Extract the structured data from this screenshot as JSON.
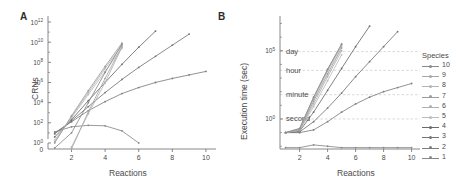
{
  "figure": {
    "panel_a_letter": "A",
    "panel_b_letter": "B"
  },
  "panel_a": {
    "ylabel": "CRNs",
    "xlabel": "Reactions",
    "y_ticks": [
      "0",
      "10^0",
      "10^2",
      "10^4",
      "10^6",
      "10^8",
      "10^10",
      "10^12"
    ],
    "y_tick_mantissa": "10",
    "y_tick_exponents": [
      "0",
      "2",
      "4",
      "6",
      "8",
      "10",
      "12"
    ],
    "x_ticks": [
      "2",
      "4",
      "6",
      "8",
      "10"
    ]
  },
  "panel_b": {
    "ylabel": "Execution time (sec)",
    "xlabel": "Reactions",
    "y_tick_exponents": [
      "0",
      "5"
    ],
    "y_tick_mantissa": "10",
    "x_ticks": [
      "2",
      "4",
      "6",
      "8",
      "10"
    ],
    "gridline_annotations": [
      "day",
      "hour",
      "minute",
      "second"
    ]
  },
  "legend": {
    "title": "Species",
    "items": [
      {
        "label": "10",
        "color": "#8a8a8a"
      },
      {
        "label": "9",
        "color": "#a8a8a8"
      },
      {
        "label": "8",
        "color": "#b4b4b4"
      },
      {
        "label": "7",
        "color": "#9c9c9c"
      },
      {
        "label": "6",
        "color": "#b0b0b0"
      },
      {
        "label": "5",
        "color": "#bcbcbc"
      },
      {
        "label": "4",
        "color": "#6a6a6a"
      },
      {
        "label": "3",
        "color": "#757575"
      },
      {
        "label": "2",
        "color": "#7e7e7e"
      },
      {
        "label": "1",
        "color": "#888888"
      }
    ]
  },
  "chart_data": [
    {
      "type": "line",
      "panel": "A",
      "title": "",
      "xlabel": "Reactions",
      "ylabel": "CRNs",
      "xlim": [
        0.6,
        10.6
      ],
      "ylim_log10": [
        -0.6,
        12.4
      ],
      "yscale": "log",
      "grid": false,
      "legend_position": "right-outside",
      "series": [
        {
          "name": "1",
          "color": "#888888",
          "x": [
            1,
            2,
            3,
            4,
            5,
            6
          ],
          "y_log10": [
            1.1,
            1.6,
            1.75,
            1.7,
            1.2,
            0.0
          ]
        },
        {
          "name": "2",
          "color": "#7e7e7e",
          "x": [
            1,
            2,
            3,
            4,
            5,
            6,
            7,
            8,
            9,
            10
          ],
          "y_log10": [
            1.0,
            2.1,
            3.2,
            4.1,
            4.9,
            5.5,
            6.0,
            6.4,
            6.75,
            7.1
          ]
        },
        {
          "name": "3",
          "color": "#757575",
          "x": [
            1,
            2,
            3,
            4,
            5,
            6,
            7,
            8,
            9
          ],
          "y_log10": [
            0.9,
            2.2,
            3.6,
            5.0,
            6.3,
            7.5,
            8.6,
            9.7,
            10.8
          ]
        },
        {
          "name": "4",
          "color": "#6a6a6a",
          "x": [
            1,
            2,
            3,
            4,
            5,
            6,
            7
          ],
          "y_log10": [
            0.6,
            2.3,
            4.2,
            6.0,
            7.8,
            9.5,
            11.1
          ]
        },
        {
          "name": "5",
          "color": "#bcbcbc",
          "x": [
            1,
            2,
            3,
            4,
            5
          ],
          "y_log10": [
            0.3,
            2.5,
            4.8,
            7.1,
            9.4
          ]
        },
        {
          "name": "6",
          "color": "#b0b0b0",
          "x": [
            1,
            2,
            3,
            4,
            5
          ],
          "y_log10": [
            0.1,
            2.6,
            5.0,
            7.4,
            9.7
          ]
        },
        {
          "name": "7",
          "color": "#9c9c9c",
          "x": [
            1,
            2,
            3,
            4,
            5
          ],
          "y_log10": [
            0.0,
            2.7,
            5.2,
            7.6,
            9.9
          ]
        },
        {
          "name": "8",
          "color": "#b4b4b4",
          "x": [
            2,
            3,
            4,
            5
          ],
          "y_log10": [
            -0.4,
            2.9,
            6.0,
            9.5
          ]
        },
        {
          "name": "9",
          "color": "#a8a8a8",
          "x": [
            2,
            3,
            4,
            5
          ],
          "y_log10": [
            -0.6,
            3.1,
            6.4,
            9.6
          ]
        },
        {
          "name": "10",
          "color": "#8a8a8a",
          "x": [
            1,
            2,
            3,
            4,
            5
          ],
          "y_log10": [
            -0.5,
            1.0,
            4.0,
            7.0,
            9.8
          ]
        }
      ]
    },
    {
      "type": "line",
      "panel": "B",
      "title": "",
      "xlabel": "Reactions",
      "ylabel": "Execution time (sec)",
      "xlim": [
        0.6,
        10.6
      ],
      "ylim_log10": [
        -2.2,
        7.4
      ],
      "yscale": "log",
      "grid": true,
      "legend_position": "right-outside",
      "gridlines": [
        {
          "label": "day",
          "y_log10": 4.94
        },
        {
          "label": "hour",
          "y_log10": 3.56
        },
        {
          "label": "minute",
          "y_log10": 1.78
        },
        {
          "label": "second",
          "y_log10": 0.0
        }
      ],
      "series": [
        {
          "name": "1",
          "color": "#888888",
          "x": [
            1,
            2,
            3,
            4,
            5,
            6,
            7,
            8,
            9,
            10
          ],
          "y_log10": [
            -2.1,
            -2.1,
            -1.9,
            -2.0,
            -2.1,
            -2.1,
            -2.1,
            -2.1,
            -2.1,
            -2.1
          ]
        },
        {
          "name": "2",
          "color": "#7e7e7e",
          "x": [
            1,
            2,
            3,
            4,
            5,
            6,
            7,
            8,
            9,
            10
          ],
          "y_log10": [
            -1.0,
            -1.0,
            -0.8,
            -0.2,
            0.5,
            1.1,
            1.6,
            2.0,
            2.3,
            2.6
          ]
        },
        {
          "name": "3",
          "color": "#757575",
          "x": [
            1,
            2,
            3,
            4,
            5,
            6,
            7,
            8,
            9
          ],
          "y_log10": [
            -1.0,
            -0.95,
            -0.2,
            0.8,
            1.9,
            3.1,
            4.2,
            5.3,
            6.4
          ]
        },
        {
          "name": "4",
          "color": "#6a6a6a",
          "x": [
            1,
            2,
            3,
            4,
            5,
            6,
            7
          ],
          "y_log10": [
            -1.0,
            -0.9,
            0.5,
            2.1,
            3.7,
            5.3,
            6.8
          ]
        },
        {
          "name": "5",
          "color": "#bcbcbc",
          "x": [
            1,
            2,
            3,
            4,
            5
          ],
          "y_log10": [
            -1.0,
            -0.85,
            0.9,
            2.8,
            4.7
          ]
        },
        {
          "name": "6",
          "color": "#b0b0b0",
          "x": [
            1,
            2,
            3,
            4,
            5
          ],
          "y_log10": [
            -1.0,
            -0.8,
            1.1,
            3.1,
            5.0
          ]
        },
        {
          "name": "7",
          "color": "#9c9c9c",
          "x": [
            1,
            2,
            3,
            4,
            5
          ],
          "y_log10": [
            -1.0,
            -0.8,
            1.3,
            3.3,
            5.2
          ]
        },
        {
          "name": "8",
          "color": "#b4b4b4",
          "x": [
            1,
            2,
            3,
            4,
            5
          ],
          "y_log10": [
            -1.0,
            -0.75,
            1.45,
            3.5,
            5.35
          ]
        },
        {
          "name": "9",
          "color": "#a8a8a8",
          "x": [
            1,
            2,
            3,
            4,
            5
          ],
          "y_log10": [
            -1.0,
            -0.7,
            1.55,
            3.6,
            5.45
          ]
        },
        {
          "name": "10",
          "color": "#8a8a8a",
          "x": [
            1,
            2,
            3,
            4,
            5
          ],
          "y_log10": [
            -1.0,
            -0.7,
            1.6,
            3.65,
            5.5
          ]
        }
      ]
    }
  ]
}
